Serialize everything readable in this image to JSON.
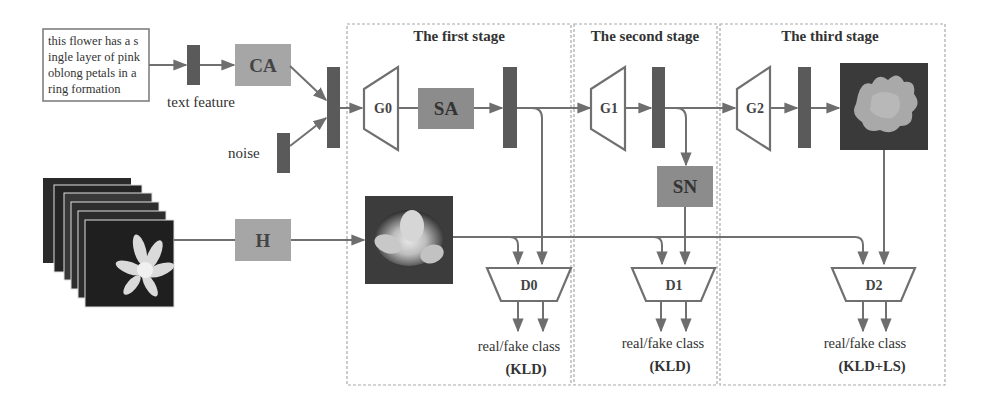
{
  "diagram": {
    "input_text": {
      "lines": [
        "this flower has a s",
        "ingle layer of pink",
        "oblong petals in a",
        "ring formation"
      ]
    },
    "labels": {
      "text_feature": "text feature",
      "noise": "noise",
      "ca": "CA",
      "sa": "SA",
      "sn": "SN",
      "h": "H",
      "g0": "G0",
      "g1": "G1",
      "g2": "G2",
      "d0": "D0",
      "d1": "D1",
      "d2": "D2"
    },
    "stages": [
      {
        "title": "The first stage",
        "output": "real/fake class",
        "loss": "(KLD)"
      },
      {
        "title": "The second stage",
        "output": "real/fake class",
        "loss": "(KLD)"
      },
      {
        "title": "The third stage",
        "output": "real/fake class",
        "loss": "(KLD+LS)"
      }
    ],
    "colors": {
      "stroke": "#707070",
      "bar": "#5a5a5a",
      "box_light": "#a6a6a6",
      "box_dark": "#8c8c8c",
      "dashed": "#aaaaaa"
    }
  }
}
